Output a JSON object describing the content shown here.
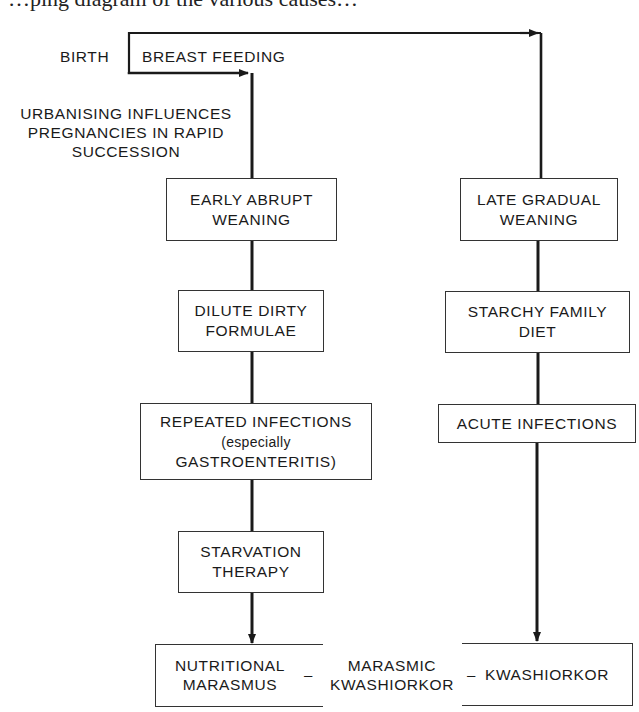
{
  "page": {
    "cropped_header_text": "…ping diagram of the various causes…"
  },
  "diagram": {
    "start": {
      "birth": "BIRTH",
      "breast_feeding": "BREAST FEEDING",
      "influences": [
        "URBANISING INFLUENCES",
        "PREGNANCIES IN RAPID",
        "SUCCESSION"
      ]
    },
    "left_path": [
      {
        "lines": [
          "EARLY ABRUPT",
          "WEANING"
        ]
      },
      {
        "lines": [
          "DILUTE DIRTY",
          "FORMULAE"
        ]
      },
      {
        "lines": [
          "REPEATED INFECTIONS",
          "(especially",
          "GASTROENTERITIS)"
        ]
      },
      {
        "lines": [
          "STARVATION",
          "THERAPY"
        ]
      }
    ],
    "right_path": [
      {
        "lines": [
          "LATE GRADUAL",
          "WEANING"
        ]
      },
      {
        "lines": [
          "STARCHY FAMILY",
          "DIET"
        ]
      },
      {
        "lines": [
          "ACUTE INFECTIONS"
        ]
      }
    ],
    "outcomes": {
      "left": [
        "NUTRITIONAL",
        "MARASMUS"
      ],
      "middle": [
        "MARASMIC",
        "KWASHIORKOR"
      ],
      "right": "KWASHIORKOR",
      "separator": "–"
    },
    "colors": {
      "line": "#1a1a1a",
      "background": "#ffffff"
    }
  }
}
